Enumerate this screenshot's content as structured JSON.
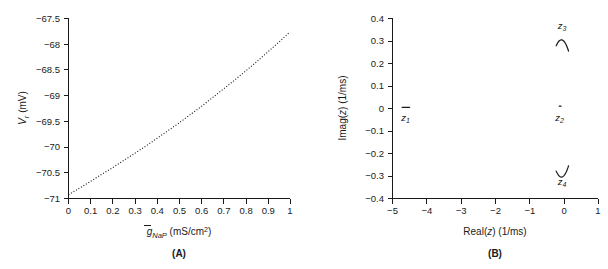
{
  "figure": {
    "panels": [
      "A",
      "B"
    ],
    "panel_a_caption": "(A)",
    "panel_b_caption": "(B)"
  },
  "chart_data": [
    {
      "type": "line",
      "panel": "A",
      "title": "",
      "xlabel": "ḡ_NaP (mS/cm^2)",
      "xlabel_parts": {
        "symbol": "g",
        "overbar": true,
        "subscript": "NaP",
        "units": "(mS/cm",
        "exponent": "2",
        "units_close": ")"
      },
      "ylabel": "V_r (mV)",
      "ylabel_parts": {
        "symbol": "V",
        "subscript": "r",
        "units": "(mV)"
      },
      "xlim": [
        0,
        1
      ],
      "ylim": [
        -71,
        -67.5
      ],
      "xticks": [
        0,
        0.1,
        0.2,
        0.3,
        0.4,
        0.5,
        0.6,
        0.7,
        0.8,
        0.9,
        1
      ],
      "xticklabels": [
        "0",
        "0.1",
        "0.2",
        "0.3",
        "0.4",
        "0.5",
        "0.6",
        "0.7",
        "0.8",
        "0.9",
        "1"
      ],
      "yticks": [
        -67.5,
        -68,
        -68.5,
        -69,
        -69.5,
        -70,
        -70.5,
        -71
      ],
      "yticklabels": [
        "−67.5",
        "−68",
        "−68.5",
        "−69",
        "−69.5",
        "−70",
        "−70.5",
        "−71"
      ],
      "grid": false,
      "legend": "none",
      "linestyle": "dotted",
      "series": [
        {
          "name": "resting potential vs persistent sodium conductance",
          "x": [
            0.0,
            0.05,
            0.1,
            0.15,
            0.2,
            0.25,
            0.3,
            0.35,
            0.4,
            0.45,
            0.5,
            0.55,
            0.6,
            0.65,
            0.7,
            0.75,
            0.8,
            0.85,
            0.9,
            0.95,
            1.0
          ],
          "y": [
            -70.93,
            -70.8,
            -70.67,
            -70.53,
            -70.4,
            -70.26,
            -70.12,
            -69.98,
            -69.83,
            -69.68,
            -69.53,
            -69.37,
            -69.21,
            -69.04,
            -68.87,
            -68.7,
            -68.52,
            -68.34,
            -68.15,
            -67.96,
            -67.76
          ]
        }
      ]
    },
    {
      "type": "scatter",
      "panel": "B",
      "title": "",
      "xlabel": "Real(z) (1/ms)",
      "xlabel_parts": {
        "prefix": "Real(",
        "symbol": "z",
        "suffix": ") (1/ms)"
      },
      "ylabel": "Imag(z) (1/ms)",
      "ylabel_parts": {
        "prefix": "Imag(",
        "symbol": "z",
        "suffix": ") (1/ms)"
      },
      "xlim": [
        -5,
        1
      ],
      "ylim": [
        -0.4,
        0.4
      ],
      "xticks": [
        -5,
        -4,
        -3,
        -2,
        -1,
        0,
        1
      ],
      "xticklabels": [
        "−5",
        "−4",
        "−3",
        "−2",
        "−1",
        "0",
        "1"
      ],
      "yticks": [
        0.4,
        0.3,
        0.2,
        0.1,
        0,
        -0.1,
        -0.2,
        -0.3,
        -0.4
      ],
      "yticklabels": [
        "0.4",
        "0.3",
        "0.2",
        "0.1",
        "0",
        "−0.1",
        "−0.2",
        "−0.3",
        "−0.4"
      ],
      "grid": false,
      "legend": "none",
      "eigenvalue_branches": [
        {
          "name": "z1",
          "label": "z",
          "subscript": "1",
          "label_x": -4.62,
          "label_y": -0.055,
          "shape": "short-horizontal-segment",
          "real_range": [
            -4.72,
            -4.5
          ],
          "imag": 0.005
        },
        {
          "name": "z2",
          "label": "z",
          "subscript": "2",
          "label_x": -0.12,
          "label_y": -0.055,
          "shape": "small-dot",
          "real_range": [
            -0.13,
            -0.08
          ],
          "imag": 0.01
        },
        {
          "name": "z3",
          "label": "z",
          "subscript": "3",
          "label_x": -0.05,
          "label_y": 0.355,
          "shape": "arc-cap",
          "real_range": [
            -0.22,
            0.14
          ],
          "imag_range": [
            0.255,
            0.305
          ]
        },
        {
          "name": "z4",
          "label": "z",
          "subscript": "4",
          "label_x": -0.05,
          "label_y": -0.34,
          "shape": "arc-cup",
          "real_range": [
            -0.22,
            0.14
          ],
          "imag_range": [
            -0.305,
            -0.255
          ]
        }
      ]
    }
  ],
  "colors": {
    "axis": "#1a1a1a",
    "curve": "#1a1a1a",
    "background": "#ffffff"
  }
}
